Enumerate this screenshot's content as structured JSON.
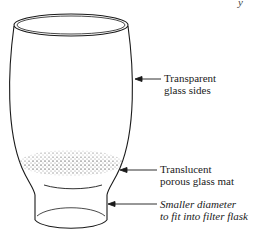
{
  "figure": {
    "type": "diagram",
    "top_fragment": "y",
    "callouts": [
      {
        "id": "sides",
        "line1": "Transparent",
        "line2": "glass sides",
        "italic": false
      },
      {
        "id": "mat",
        "line1": "Translucent",
        "line2": "porous glass mat",
        "italic": false
      },
      {
        "id": "stem",
        "line1": "Smaller diameter",
        "line2": "to fit into filter flask",
        "italic": true
      }
    ],
    "colors": {
      "line": "#1a1a1a",
      "background": "#ffffff",
      "stipple": "#555555"
    }
  }
}
